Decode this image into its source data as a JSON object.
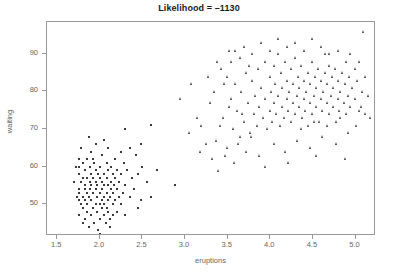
{
  "chart_data": {
    "type": "scatter",
    "title": "Likelihood = –1130",
    "xlabel": "eruptions",
    "ylabel": "waiting",
    "xlim": [
      1.38,
      5.24
    ],
    "ylim": [
      41.5,
      98.5
    ],
    "xticks": [
      1.5,
      2.0,
      2.5,
      3.0,
      3.5,
      4.0,
      4.5,
      5.0
    ],
    "xtick_labels": [
      "1.5",
      "2.0",
      "2.5",
      "3.0",
      "3.5",
      "4.0",
      "4.5",
      "5.0"
    ],
    "yticks": [
      50,
      60,
      70,
      80,
      90
    ],
    "ytick_labels": [
      "50",
      "60",
      "70",
      "80",
      "90"
    ],
    "grid": false,
    "legend": false,
    "marker_color": "#3b3b3b",
    "frame_color": "#9a9a9a",
    "series": [
      {
        "name": "cluster-1-short-eruptions",
        "marker": "square",
        "points": [
          [
            1.75,
            47
          ],
          [
            1.75,
            53
          ],
          [
            1.75,
            54
          ],
          [
            1.75,
            62
          ],
          [
            1.75,
            51
          ],
          [
            1.75,
            58
          ],
          [
            1.75,
            60
          ],
          [
            1.78,
            50
          ],
          [
            1.78,
            56
          ],
          [
            1.78,
            65
          ],
          [
            1.8,
            45
          ],
          [
            1.8,
            52
          ],
          [
            1.8,
            57
          ],
          [
            1.8,
            61
          ],
          [
            1.8,
            49
          ],
          [
            1.82,
            54
          ],
          [
            1.82,
            59
          ],
          [
            1.83,
            46
          ],
          [
            1.83,
            51
          ],
          [
            1.83,
            55
          ],
          [
            1.85,
            48
          ],
          [
            1.85,
            53
          ],
          [
            1.85,
            57
          ],
          [
            1.85,
            62
          ],
          [
            1.85,
            50
          ],
          [
            1.87,
            44
          ],
          [
            1.87,
            52
          ],
          [
            1.88,
            56
          ],
          [
            1.88,
            60
          ],
          [
            1.88,
            54
          ],
          [
            1.9,
            47
          ],
          [
            1.9,
            51
          ],
          [
            1.9,
            55
          ],
          [
            1.9,
            58
          ],
          [
            1.9,
            64
          ],
          [
            1.92,
            49
          ],
          [
            1.92,
            53
          ],
          [
            1.92,
            57
          ],
          [
            1.93,
            45
          ],
          [
            1.93,
            61
          ],
          [
            1.95,
            50
          ],
          [
            1.95,
            54
          ],
          [
            1.95,
            56
          ],
          [
            1.95,
            59
          ],
          [
            1.95,
            66
          ],
          [
            1.97,
            48
          ],
          [
            1.97,
            52
          ],
          [
            1.97,
            55
          ],
          [
            1.98,
            43
          ],
          [
            1.98,
            58
          ],
          [
            2.0,
            46
          ],
          [
            2.0,
            50
          ],
          [
            2.0,
            53
          ],
          [
            2.0,
            57
          ],
          [
            2.0,
            60
          ],
          [
            2.02,
            49
          ],
          [
            2.02,
            54
          ],
          [
            2.02,
            51
          ],
          [
            2.03,
            56
          ],
          [
            2.03,
            63
          ],
          [
            2.05,
            47
          ],
          [
            2.05,
            52
          ],
          [
            2.05,
            55
          ],
          [
            2.05,
            58
          ],
          [
            2.05,
            50
          ],
          [
            2.07,
            45
          ],
          [
            2.08,
            53
          ],
          [
            2.08,
            57
          ],
          [
            2.08,
            61
          ],
          [
            2.08,
            49
          ],
          [
            2.1,
            48
          ],
          [
            2.1,
            51
          ],
          [
            2.1,
            55
          ],
          [
            2.1,
            59
          ],
          [
            2.1,
            65
          ],
          [
            2.12,
            46
          ],
          [
            2.12,
            52
          ],
          [
            2.13,
            56
          ],
          [
            2.13,
            54
          ],
          [
            2.13,
            60
          ],
          [
            2.15,
            50
          ],
          [
            2.15,
            53
          ],
          [
            2.15,
            58
          ],
          [
            2.15,
            47
          ],
          [
            2.17,
            55
          ],
          [
            2.18,
            51
          ],
          [
            2.18,
            57
          ],
          [
            2.18,
            62
          ],
          [
            2.2,
            48
          ],
          [
            2.2,
            54
          ],
          [
            2.2,
            59
          ],
          [
            2.22,
            52
          ],
          [
            2.23,
            56
          ],
          [
            2.25,
            50
          ],
          [
            2.25,
            58
          ],
          [
            2.27,
            53
          ],
          [
            2.28,
            61
          ],
          [
            2.3,
            55
          ],
          [
            2.3,
            47
          ],
          [
            2.32,
            59
          ],
          [
            2.35,
            52
          ],
          [
            2.38,
            57
          ],
          [
            2.4,
            54
          ],
          [
            2.42,
            63
          ],
          [
            2.45,
            58
          ],
          [
            2.48,
            51
          ],
          [
            2.5,
            60
          ],
          [
            2.55,
            56
          ],
          [
            2.6,
            71
          ],
          [
            2.67,
            59
          ],
          [
            1.7,
            56
          ],
          [
            1.72,
            60
          ],
          [
            1.73,
            52
          ],
          [
            2.88,
            55
          ],
          [
            2.35,
            65
          ],
          [
            2.05,
            67
          ],
          [
            1.87,
            68
          ],
          [
            2.48,
            66
          ],
          [
            2.3,
            70
          ],
          [
            2.12,
            44
          ],
          [
            2.0,
            42
          ],
          [
            1.92,
            62
          ],
          [
            2.25,
            64
          ],
          [
            2.6,
            52
          ],
          [
            2.45,
            49
          ]
        ]
      },
      {
        "name": "cluster-2-long-eruptions",
        "marker": "triangle",
        "points": [
          [
            3.45,
            73
          ],
          [
            3.5,
            65
          ],
          [
            3.55,
            78
          ],
          [
            3.57,
            70
          ],
          [
            3.6,
            82
          ],
          [
            3.62,
            75
          ],
          [
            3.65,
            68
          ],
          [
            3.67,
            80
          ],
          [
            3.7,
            72
          ],
          [
            3.72,
            85
          ],
          [
            3.75,
            77
          ],
          [
            3.77,
            69
          ],
          [
            3.8,
            83
          ],
          [
            3.82,
            74
          ],
          [
            3.83,
            79
          ],
          [
            3.85,
            71
          ],
          [
            3.87,
            86
          ],
          [
            3.88,
            76
          ],
          [
            3.9,
            81
          ],
          [
            3.92,
            73
          ],
          [
            3.95,
            78
          ],
          [
            3.95,
            88
          ],
          [
            3.97,
            70
          ],
          [
            4.0,
            84
          ],
          [
            4.0,
            75
          ],
          [
            4.02,
            80
          ],
          [
            4.03,
            72
          ],
          [
            4.05,
            87
          ],
          [
            4.05,
            77
          ],
          [
            4.07,
            82
          ],
          [
            4.08,
            74
          ],
          [
            4.1,
            79
          ],
          [
            4.1,
            90
          ],
          [
            4.12,
            71
          ],
          [
            4.13,
            85
          ],
          [
            4.15,
            76
          ],
          [
            4.15,
            81
          ],
          [
            4.17,
            73
          ],
          [
            4.18,
            88
          ],
          [
            4.2,
            78
          ],
          [
            4.2,
            83
          ],
          [
            4.22,
            75
          ],
          [
            4.23,
            80
          ],
          [
            4.25,
            86
          ],
          [
            4.25,
            72
          ],
          [
            4.27,
            77
          ],
          [
            4.28,
            82
          ],
          [
            4.3,
            74
          ],
          [
            4.3,
            89
          ],
          [
            4.32,
            79
          ],
          [
            4.33,
            84
          ],
          [
            4.35,
            76
          ],
          [
            4.35,
            81
          ],
          [
            4.37,
            87
          ],
          [
            4.38,
            73
          ],
          [
            4.4,
            78
          ],
          [
            4.4,
            83
          ],
          [
            4.42,
            75
          ],
          [
            4.43,
            80
          ],
          [
            4.45,
            85
          ],
          [
            4.45,
            71
          ],
          [
            4.47,
            77
          ],
          [
            4.48,
            82
          ],
          [
            4.5,
            74
          ],
          [
            4.5,
            88
          ],
          [
            4.52,
            79
          ],
          [
            4.53,
            84
          ],
          [
            4.55,
            76
          ],
          [
            4.55,
            81
          ],
          [
            4.57,
            86
          ],
          [
            4.58,
            72
          ],
          [
            4.6,
            78
          ],
          [
            4.6,
            83
          ],
          [
            4.62,
            75
          ],
          [
            4.63,
            80
          ],
          [
            4.65,
            85
          ],
          [
            4.65,
            90
          ],
          [
            4.67,
            77
          ],
          [
            4.68,
            82
          ],
          [
            4.7,
            74
          ],
          [
            4.7,
            87
          ],
          [
            4.72,
            79
          ],
          [
            4.73,
            84
          ],
          [
            4.75,
            76
          ],
          [
            4.75,
            81
          ],
          [
            4.77,
            86
          ],
          [
            4.78,
            72
          ],
          [
            4.8,
            78
          ],
          [
            4.8,
            83
          ],
          [
            4.82,
            75
          ],
          [
            4.83,
            80
          ],
          [
            4.85,
            85
          ],
          [
            4.87,
            77
          ],
          [
            4.88,
            82
          ],
          [
            4.9,
            74
          ],
          [
            4.9,
            88
          ],
          [
            4.92,
            79
          ],
          [
            4.93,
            84
          ],
          [
            4.95,
            76
          ],
          [
            4.97,
            81
          ],
          [
            5.0,
            86
          ],
          [
            5.0,
            78
          ],
          [
            5.03,
            83
          ],
          [
            5.05,
            75
          ],
          [
            5.08,
            80
          ],
          [
            5.1,
            96
          ],
          [
            5.12,
            84
          ],
          [
            5.15,
            79
          ],
          [
            5.18,
            73
          ],
          [
            3.33,
            62
          ],
          [
            3.37,
            67
          ],
          [
            3.4,
            59
          ],
          [
            3.42,
            71
          ],
          [
            3.48,
            63
          ],
          [
            3.58,
            61
          ],
          [
            3.63,
            66
          ],
          [
            3.68,
            74
          ],
          [
            3.73,
            64
          ],
          [
            3.78,
            68
          ],
          [
            3.2,
            71
          ],
          [
            3.25,
            66
          ],
          [
            3.15,
            73
          ],
          [
            3.05,
            69
          ],
          [
            3.3,
            77
          ],
          [
            3.35,
            80
          ],
          [
            3.5,
            84
          ],
          [
            3.55,
            88
          ],
          [
            3.6,
            91
          ],
          [
            3.65,
            89
          ],
          [
            3.7,
            92
          ],
          [
            3.8,
            90
          ],
          [
            3.9,
            93
          ],
          [
            4.0,
            91
          ],
          [
            4.1,
            94
          ],
          [
            4.2,
            92
          ],
          [
            4.3,
            93
          ],
          [
            4.4,
            91
          ],
          [
            4.5,
            94
          ],
          [
            4.6,
            92
          ],
          [
            4.7,
            90
          ],
          [
            4.8,
            91
          ],
          [
            4.95,
            90
          ],
          [
            5.05,
            88
          ],
          [
            3.88,
            63
          ],
          [
            4.05,
            66
          ],
          [
            4.18,
            64
          ],
          [
            4.32,
            67
          ],
          [
            4.48,
            65
          ],
          [
            4.62,
            68
          ],
          [
            4.78,
            66
          ],
          [
            4.92,
            69
          ],
          [
            5.02,
            71
          ],
          [
            5.12,
            74
          ],
          [
            3.95,
            60
          ],
          [
            4.22,
            61
          ],
          [
            4.55,
            63
          ],
          [
            4.88,
            62
          ],
          [
            3.43,
            86
          ],
          [
            3.47,
            82
          ],
          [
            3.52,
            76
          ],
          [
            3.53,
            91
          ],
          [
            3.76,
            87
          ],
          [
            4.37,
            70
          ],
          [
            4.52,
            72
          ],
          [
            4.67,
            71
          ],
          [
            4.83,
            73
          ],
          [
            5.07,
            76
          ],
          [
            3.28,
            84
          ],
          [
            3.38,
            88
          ],
          [
            3.18,
            64
          ],
          [
            2.95,
            78
          ],
          [
            3.08,
            82
          ]
        ]
      }
    ]
  }
}
